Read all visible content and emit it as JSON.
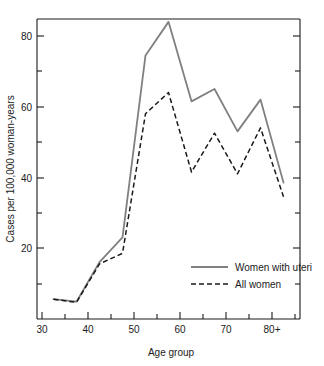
{
  "chart_data": {
    "type": "line",
    "title": "",
    "xlabel": "Age group",
    "ylabel": "Cases per 100,000 woman-years",
    "xlim": [
      30,
      87
    ],
    "ylim": [
      0,
      87
    ],
    "grid": false,
    "legend_position": "inside-bottom-right",
    "x_major_ticks": [
      30,
      40,
      50,
      60,
      70,
      80
    ],
    "x_major_tick_labels": [
      "30",
      "40",
      "50",
      "60",
      "70",
      "80+"
    ],
    "x_minor_ticks": [
      35,
      45,
      55,
      65,
      75,
      85
    ],
    "y_major_ticks": [
      20,
      40,
      60,
      80
    ],
    "y_major_tick_labels": [
      "20",
      "40",
      "60",
      "80"
    ],
    "y_minor_ticks": [
      10,
      30,
      50,
      70
    ],
    "x": [
      32.5,
      37.5,
      42.5,
      47.5,
      52.5,
      57.5,
      62.5,
      67.5,
      72.5,
      77.5,
      82.5
    ],
    "series": [
      {
        "name": "Women with uteri",
        "style": "solid",
        "color": "#808080",
        "values": [
          5.5,
          4.8,
          16.0,
          23.0,
          74.5,
          84.0,
          61.5,
          65.0,
          53.0,
          62.0,
          38.5
        ]
      },
      {
        "name": "All women",
        "style": "dashed",
        "color": "#1a1a1a",
        "values": [
          5.5,
          4.6,
          15.5,
          18.5,
          58.0,
          64.0,
          41.5,
          52.5,
          41.0,
          54.0,
          34.5
        ]
      }
    ]
  },
  "legend": {
    "items": [
      {
        "label": "Women with uteri"
      },
      {
        "label": "All women"
      }
    ]
  }
}
